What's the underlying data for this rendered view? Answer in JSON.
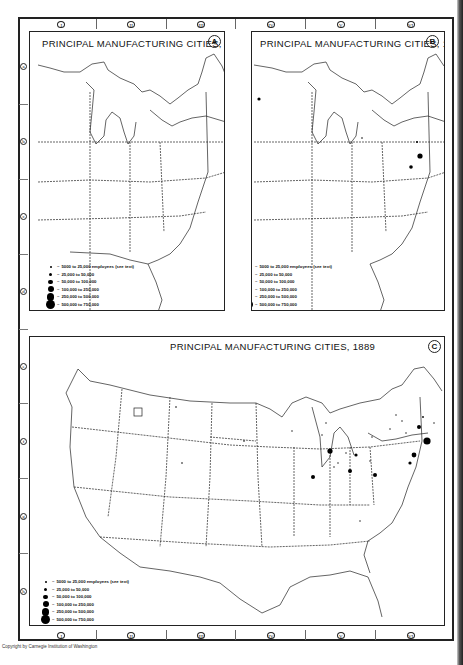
{
  "columns": [
    "I",
    "II",
    "III",
    "IV",
    "V",
    "VI"
  ],
  "rows": [
    "a",
    "b",
    "c",
    "d",
    "e",
    "f",
    "g",
    "h"
  ],
  "panels": [
    {
      "id": "A",
      "title": "PRINCIPAL MANUFACTURING  CITIES, 1839",
      "label": "A"
    },
    {
      "id": "B",
      "title": "PRINCIPAL MANUFACTURING CITIES, 1859",
      "label": "B"
    },
    {
      "id": "C",
      "title": "PRINCIPAL MANUFACTURING CITIES, 1889",
      "label": "C"
    }
  ],
  "legend": {
    "items": [
      {
        "size": 2,
        "label": "5000 to 25,000 employees (see text)"
      },
      {
        "size": 3,
        "label": "25,000 to 50,000"
      },
      {
        "size": 4.5,
        "label": "50,000 to 100,000"
      },
      {
        "size": 6,
        "label": "100,000 to 250,000"
      },
      {
        "size": 7.5,
        "label": "250,000 to 500,000"
      },
      {
        "size": 9,
        "label": "500,000 to 750,000"
      }
    ]
  },
  "copyright": "Copyright by Carnegie Institution of Washington"
}
